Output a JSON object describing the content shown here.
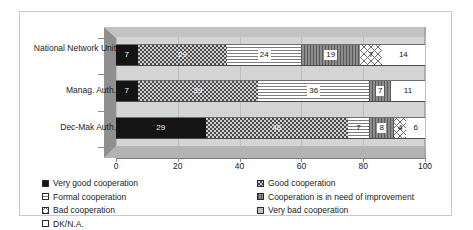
{
  "chart_data": {
    "type": "bar",
    "orientation": "horizontal",
    "stacked": true,
    "stacked_mode": "percent",
    "title": "",
    "subtitle": "",
    "xlabel": "",
    "ylabel": "",
    "xlim": [
      0,
      100
    ],
    "xticks": [
      0,
      20,
      40,
      60,
      80,
      100
    ],
    "xtick_labels": [
      "0",
      "20",
      "40",
      "60",
      "80",
      "100"
    ],
    "grid": true,
    "grid_axis": "x",
    "legend_position": "bottom",
    "three_d": true,
    "categories": [
      "National Network Unit",
      "Manag. Auth.",
      "Dec-Mak Auth."
    ],
    "series": [
      {
        "name": "Very good cooperation",
        "key": "very_good",
        "pattern": "solid-black",
        "color": "#141414",
        "values": [
          7,
          7,
          29
        ]
      },
      {
        "name": "Good cooperation",
        "key": "good",
        "pattern": "dotted-dark-gray",
        "color": "#4c4c4c",
        "values": [
          29,
          39,
          46
        ]
      },
      {
        "name": "Formal cooperation",
        "key": "formal",
        "pattern": "horizontal-lines",
        "color": "#e9e9e9",
        "values": [
          24,
          36,
          7
        ]
      },
      {
        "name": "Cooperation is in need of improvement",
        "key": "need_improvement",
        "pattern": "vertical-lines-gray",
        "color": "#6b6b6b",
        "values": [
          19,
          7,
          8
        ]
      },
      {
        "name": "Bad cooperation",
        "key": "bad",
        "pattern": "crosshatch",
        "color": "#fbfbfb",
        "values": [
          7,
          0,
          4
        ]
      },
      {
        "name": "Very bad cooperation",
        "key": "very_bad",
        "pattern": "solid-light-gray",
        "color": "#c2c2c2",
        "values": [
          0,
          0,
          0
        ]
      },
      {
        "name": "DK/N.A.",
        "key": "dk_na",
        "pattern": "solid-white",
        "color": "#ffffff",
        "values": [
          14,
          11,
          6
        ]
      }
    ],
    "rows": [
      {
        "category": "National Network Unit",
        "segments": [
          {
            "series": "Very good cooperation",
            "value": 7,
            "label": "7",
            "pattern": "solid-black",
            "label_style": "plain-light"
          },
          {
            "series": "Good cooperation",
            "value": 29,
            "label": "29",
            "pattern": "dotted-dark-gray",
            "label_style": "plain-light"
          },
          {
            "series": "Formal cooperation",
            "value": 24,
            "label": "24",
            "pattern": "horizontal-lines",
            "label_style": "boxed"
          },
          {
            "series": "Cooperation is in need of improvement",
            "value": 19,
            "label": "19",
            "pattern": "vertical-lines-gray",
            "label_style": "boxed"
          },
          {
            "series": "Bad cooperation",
            "value": 7,
            "label": "7",
            "pattern": "crosshatch",
            "label_style": "plain-dark"
          },
          {
            "series": "DK/N.A.",
            "value": 14,
            "label": "14",
            "pattern": "solid-white",
            "label_style": "plain-dark"
          }
        ]
      },
      {
        "category": "Manag. Auth.",
        "segments": [
          {
            "series": "Very good cooperation",
            "value": 7,
            "label": "7",
            "pattern": "solid-black",
            "label_style": "plain-light"
          },
          {
            "series": "Good cooperation",
            "value": 39,
            "label": "39",
            "pattern": "dotted-dark-gray",
            "label_style": "plain-light"
          },
          {
            "series": "Formal cooperation",
            "value": 36,
            "label": "36",
            "pattern": "horizontal-lines",
            "label_style": "boxed"
          },
          {
            "series": "Cooperation is in need of improvement",
            "value": 7,
            "label": "7",
            "pattern": "vertical-lines-gray",
            "label_style": "boxed"
          },
          {
            "series": "DK/N.A.",
            "value": 11,
            "label": "11",
            "pattern": "solid-white",
            "label_style": "plain-dark"
          }
        ]
      },
      {
        "category": "Dec-Mak Auth.",
        "segments": [
          {
            "series": "Very good cooperation",
            "value": 29,
            "label": "29",
            "pattern": "solid-black",
            "label_style": "plain-light"
          },
          {
            "series": "Good cooperation",
            "value": 46,
            "label": "46",
            "pattern": "dotted-dark-gray",
            "label_style": "plain-light"
          },
          {
            "series": "Formal cooperation",
            "value": 7,
            "label": "7",
            "pattern": "horizontal-lines",
            "label_style": "plain-dark"
          },
          {
            "series": "Cooperation is in need of improvement",
            "value": 8,
            "label": "8",
            "pattern": "vertical-lines-gray",
            "label_style": "boxed"
          },
          {
            "series": "Bad cooperation",
            "value": 4,
            "label": "4",
            "pattern": "crosshatch",
            "label_style": "plain-dark"
          },
          {
            "series": "DK/N.A.",
            "value": 6,
            "label": "6",
            "pattern": "solid-white",
            "label_style": "plain-dark"
          }
        ]
      }
    ],
    "legend": {
      "left_column": [
        {
          "label": "Very good cooperation",
          "pattern": "solid-black"
        },
        {
          "label": "Formal cooperation",
          "pattern": "horizontal-lines"
        },
        {
          "label": "Bad cooperation",
          "pattern": "crosshatch"
        },
        {
          "label": "DK/N.A.",
          "pattern": "solid-white"
        }
      ],
      "right_column": [
        {
          "label": "Good cooperation",
          "pattern": "dotted-dark-gray"
        },
        {
          "label": "Cooperation is in need of improvement",
          "pattern": "vertical-lines-gray"
        },
        {
          "label": "Very bad cooperation",
          "pattern": "solid-light-gray"
        }
      ]
    }
  }
}
